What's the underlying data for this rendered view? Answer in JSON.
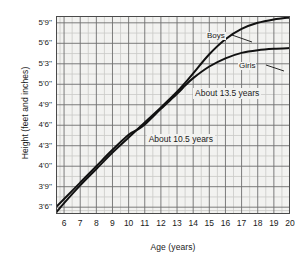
{
  "chart_data": {
    "type": "line",
    "title": "",
    "xlabel": "Age (years)",
    "ylabel": "Height (feet and inches)",
    "xlim": [
      5.5,
      20
    ],
    "ylim": [
      41,
      70
    ],
    "xticks": [
      6,
      7,
      8,
      9,
      10,
      11,
      12,
      13,
      14,
      15,
      16,
      17,
      18,
      19,
      20
    ],
    "xticklabels": [
      "6",
      "7",
      "8",
      "9",
      "10",
      "11",
      "12",
      "13",
      "14",
      "15",
      "16",
      "17",
      "18",
      "19",
      "20"
    ],
    "yticks": [
      42,
      45,
      48,
      51,
      54,
      57,
      60,
      63,
      66,
      69
    ],
    "yticklabels": [
      "3'6''",
      "3'9''",
      "4'0''",
      "4'3''",
      "4'6''",
      "4'9''",
      "5'0''",
      "5'3''",
      "5'6''",
      "5'9''"
    ],
    "grid": true,
    "minor_grid": true,
    "legend": "inline-labels",
    "series": [
      {
        "name": "Boys",
        "label": "Boys",
        "x": [
          5.5,
          6,
          7,
          8,
          9,
          10,
          10.5,
          11,
          12,
          13,
          13.5,
          14,
          15,
          16,
          17,
          18,
          19,
          20
        ],
        "values": [
          41.2,
          42.6,
          45.2,
          47.6,
          50.0,
          52.2,
          53.3,
          54.4,
          56.6,
          58.9,
          60.2,
          61.6,
          64.4,
          66.6,
          68.1,
          69.0,
          69.5,
          69.8
        ]
      },
      {
        "name": "Girls",
        "label": "Girls",
        "x": [
          5.5,
          6,
          7,
          8,
          9,
          10,
          10.5,
          11,
          12,
          13,
          13.5,
          14,
          15,
          16,
          17,
          18,
          19,
          20
        ],
        "values": [
          42.0,
          43.2,
          45.6,
          48.0,
          50.4,
          52.6,
          53.3,
          54.1,
          56.4,
          58.6,
          59.8,
          60.9,
          62.6,
          63.8,
          64.6,
          65.0,
          65.2,
          65.3
        ]
      }
    ],
    "annotations": [
      {
        "text": "About 10.5 years",
        "x": 10.5,
        "y": 53.3,
        "note": "lower crossing point of the two curves"
      },
      {
        "text": "About 13.5 years",
        "x": 13.5,
        "y": 60.0,
        "note": "upper crossing point of the two curves"
      }
    ],
    "colors": {
      "plot_background": "#f2f2f0",
      "grid_major": "#6e6e6e",
      "grid_minor": "#c9c9c6",
      "curve": "#111111",
      "frame": "#4a4a4a"
    }
  }
}
